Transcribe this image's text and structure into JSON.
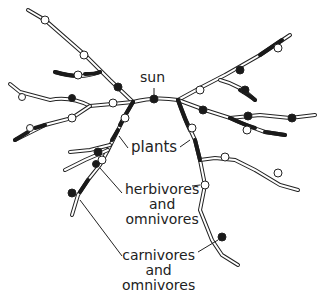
{
  "diagram": {
    "labels": {
      "sun": "sun",
      "plants": "plants",
      "herbivores": [
        "herbivores",
        "and",
        "omnivores"
      ],
      "carnivores": [
        "carnivores",
        "and",
        "omnivores"
      ]
    },
    "colors": {
      "line": "#222222",
      "background": "#ffffff",
      "fill_dark": "#1a1a1a",
      "fill_light": "#ffffff"
    }
  }
}
